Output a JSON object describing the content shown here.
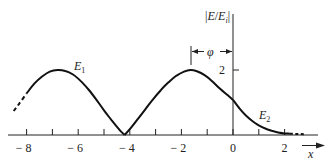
{
  "chart_data": {
    "type": "line",
    "title": "",
    "xlabel": "x",
    "ylabel": "|E/E_i|",
    "xlim": [
      -8.6,
      3.3
    ],
    "ylim": [
      0,
      2.4
    ],
    "x_ticks": [
      -8,
      -7,
      -6,
      -5,
      -4,
      -3,
      -2,
      -1,
      0,
      1,
      2
    ],
    "x_tick_labels": [
      "-8",
      "-6",
      "-4",
      "-2",
      "0",
      "2"
    ],
    "x_tick_label_values": [
      -8,
      -6,
      -4,
      -2,
      0,
      2
    ],
    "y_ticks": [
      2
    ],
    "y_tick_labels": [
      "2"
    ],
    "grid": false,
    "annotations": {
      "phi_label": "φ",
      "phi_from_x": -1.65,
      "phi_to_x": 0,
      "E1_label": "E",
      "E1_sub": "1",
      "E2_label": "E",
      "E2_sub": "2"
    },
    "series": [
      {
        "name": "E1 (standing wave, x<0)",
        "x": [
          -8.5,
          -8.3,
          -8.0,
          -7.7,
          -7.4,
          -7.1,
          -6.8,
          -6.5,
          -6.2,
          -5.9,
          -5.6,
          -5.3,
          -5.0,
          -4.7,
          -4.4,
          -4.2,
          -4.0,
          -3.7,
          -3.4,
          -3.1,
          -2.8,
          -2.5,
          -2.2,
          -1.9,
          -1.65,
          -1.4,
          -1.1,
          -0.8,
          -0.5,
          -0.2,
          0.0
        ],
        "values": [
          0.74,
          0.95,
          1.28,
          1.58,
          1.8,
          1.95,
          2.0,
          1.97,
          1.86,
          1.66,
          1.4,
          1.09,
          0.76,
          0.45,
          0.16,
          0.0,
          0.18,
          0.48,
          0.79,
          1.1,
          1.38,
          1.62,
          1.82,
          1.95,
          2.0,
          1.96,
          1.84,
          1.65,
          1.42,
          1.22,
          1.08
        ]
      },
      {
        "name": "E2 (evanescent, x>0)",
        "x": [
          0.0,
          0.25,
          0.5,
          0.75,
          1.0,
          1.25,
          1.5,
          1.75,
          2.0,
          2.2
        ],
        "values": [
          1.08,
          0.82,
          0.6,
          0.43,
          0.3,
          0.2,
          0.13,
          0.08,
          0.05,
          0.04
        ]
      }
    ],
    "dashed_segments": {
      "left": {
        "from_x": -8.5,
        "to_x": -8.0
      },
      "right": {
        "from_x": 2.2,
        "to_x": 2.8
      }
    }
  }
}
